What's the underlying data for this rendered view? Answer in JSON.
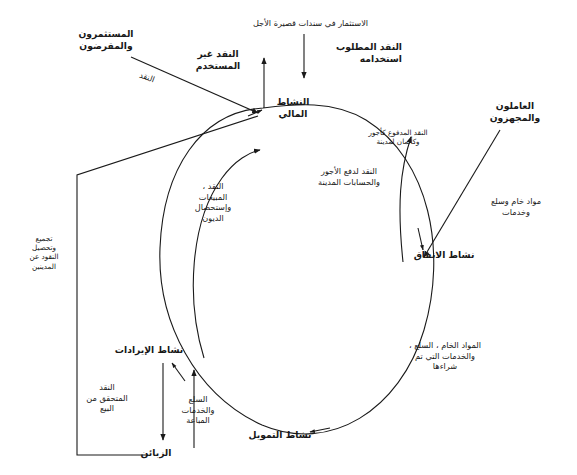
{
  "diagram": {
    "type": "cash-flow-cycle",
    "language": "ar",
    "stroke_color": "#1a1a1a",
    "background_color": "#ffffff",
    "nodes": {
      "financial_activity": "النشاط المالي",
      "spending_activity": "نشاط الانفاق",
      "financing_activity": "نشاط التمويل",
      "revenue_activity": "نشاط الإيرادات"
    },
    "external_parties": {
      "investors_lenders": "المستثمرون\nوالمقرضون",
      "workers_suppliers": "العاملون\nوالمجهزون",
      "customers": "الزبائن"
    },
    "flows": {
      "short_term_investment": "الاستثمار في سندات قصيرة الأجل",
      "cash_required_for_use": "النقد المطلوب\nاستخدامه",
      "unused_cash": "النقد غير\nالمستخدم",
      "cash": "النقد",
      "cash_paid_wages_short": "النقد المدفوع كأجور\nوكأثمان لمدينة",
      "cash_to_pay_wages": "النقد لدفع الأجور\nوالحسابات المدينة",
      "raw_materials_goods_services": "مواد خام وسلع\nوخدمات",
      "purchased_materials_goods_services": "المواد الخام ، السلع ،\nوالخدمات التي تم\nشراءها",
      "goods_services_sold": "السلع\nوالخدمات\nالمباعة",
      "cash_realized_from_sales": "النقد\nالمتحقق من\nالبيع",
      "cash_sales_debt_collection": "النقد ،\nالمبيعات\nوإستحصال\nالديون",
      "collection_from_debtors": "تجميع\nوتحصيل\nالنقود عن\nالمدينين"
    }
  }
}
